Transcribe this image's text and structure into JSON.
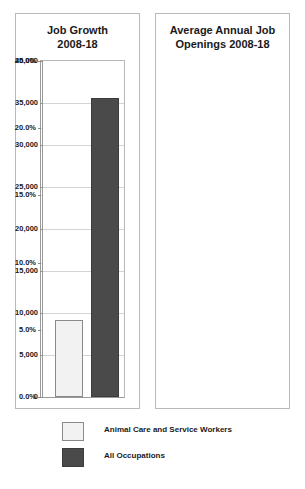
{
  "chart_data": [
    {
      "type": "bar",
      "id": "job-growth",
      "title": "Job Growth 2008-18",
      "title_lines": [
        "Job Growth",
        "2008-18"
      ],
      "xlabel": "",
      "ylabel": "",
      "categories": [
        "Animal Care and Service Workers",
        "All Occupations"
      ],
      "values": [
        20.8,
        10.5
      ],
      "ylim": [
        0.0,
        25.0
      ],
      "yticks": [
        0.0,
        5.0,
        10.0,
        15.0,
        20.0,
        25.0
      ],
      "ytick_labels": [
        "0.0%",
        "5.0%",
        "10.0%",
        "15.0%",
        "20.0%",
        "25.0%"
      ],
      "grid": true,
      "legend_position": "bottom",
      "bar_colors": [
        "#f2f2f2",
        "#4a4a4a"
      ]
    },
    {
      "type": "bar",
      "id": "job-openings",
      "title": "Average Annual Job Openings 2008-18",
      "title_lines": [
        "Average Annual Job",
        "Openings 2008-18"
      ],
      "xlabel": "",
      "ylabel": "",
      "categories": [
        "Animal Care and Service Workers",
        "All Occupations"
      ],
      "values": [
        9200,
        35600
      ],
      "ylim": [
        0,
        40000
      ],
      "yticks": [
        0,
        5000,
        10000,
        15000,
        20000,
        25000,
        30000,
        35000,
        40000
      ],
      "ytick_labels": [
        "0",
        "5,000",
        "10,000",
        "15,000",
        "20,000",
        "25,000",
        "30,000",
        "35,000",
        "40,000"
      ],
      "grid": true,
      "legend_position": "bottom",
      "bar_colors": [
        "#f2f2f2",
        "#4a4a4a"
      ]
    }
  ],
  "legend": {
    "items": [
      {
        "label": "Animal Care and Service Workers",
        "color": "#f2f2f2",
        "style": "light"
      },
      {
        "label": "All Occupations",
        "color": "#4a4a4a",
        "style": "dark"
      }
    ]
  },
  "colors": {
    "background": "#ffffff",
    "series_light": "#f2f2f2",
    "series_dark": "#4a4a4a",
    "gridline": "#d4d4d4",
    "axis": "#9a9a9a",
    "panel_border": "#b9b9b9",
    "text": "#1a1a1a"
  }
}
